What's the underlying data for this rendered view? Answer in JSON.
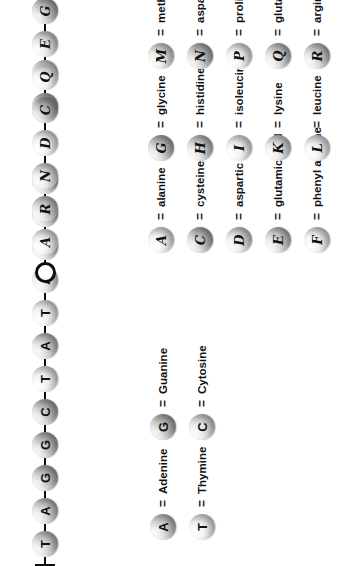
{
  "figure": {
    "orientation": "rotated-90-ccw",
    "panels": [
      "dna",
      "protein"
    ]
  },
  "dna": {
    "chain_name": "dna-strand",
    "start_marker": "bar",
    "end_marker": "solid-arrow",
    "bases": [
      "T",
      "A",
      "G",
      "G",
      "C",
      "T",
      "A",
      "T",
      "A",
      "A",
      "C",
      "C",
      "…",
      "G",
      "C"
    ],
    "gap_after_index": 11,
    "legend": {
      "column_1": [
        {
          "symbol": "A",
          "equals": "=",
          "name": "Adenine",
          "tone": "tone-3"
        },
        {
          "symbol": "T",
          "equals": "=",
          "name": "Thymine",
          "tone": "tone-1"
        }
      ],
      "column_2": [
        {
          "symbol": "G",
          "equals": "=",
          "name": "Guanine",
          "tone": "tone-4"
        },
        {
          "symbol": "C",
          "equals": "=",
          "name": "Cytosine",
          "tone": "tone-2"
        }
      ]
    }
  },
  "protein": {
    "chain_name": "amino-acid-chain",
    "start_marker": "ring",
    "end_marker": "hollow-arrow",
    "residues": [
      "A",
      "R",
      "N",
      "D",
      "C",
      "Q",
      "E",
      "G",
      "H",
      "I",
      "L",
      "K",
      "…",
      "K",
      "H"
    ],
    "gap_after_index": 11,
    "legend": {
      "column_1": [
        {
          "symbol": "A",
          "equals": "=",
          "name": "alanine",
          "tone": "tone-1"
        },
        {
          "symbol": "C",
          "equals": "=",
          "name": "cysteine",
          "tone": "tone-4"
        },
        {
          "symbol": "D",
          "equals": "=",
          "name": "aspartic acid",
          "tone": "tone-2"
        },
        {
          "symbol": "E",
          "equals": "=",
          "name": "glutamic acid",
          "tone": "tone-3"
        },
        {
          "symbol": "F",
          "equals": "=",
          "name": "phenyl alanine",
          "tone": "tone-1"
        }
      ],
      "column_2": [
        {
          "symbol": "G",
          "equals": "=",
          "name": "glycine",
          "tone": "tone-4"
        },
        {
          "symbol": "H",
          "equals": "=",
          "name": "histidine",
          "tone": "tone-3"
        },
        {
          "symbol": "I",
          "equals": "=",
          "name": "isoleucine",
          "tone": "tone-1"
        },
        {
          "symbol": "K",
          "equals": "=",
          "name": "lysine",
          "tone": "tone-2"
        },
        {
          "symbol": "L",
          "equals": "=",
          "name": "leucine",
          "tone": "tone-1"
        }
      ],
      "column_3": [
        {
          "symbol": "M",
          "equals": "=",
          "name": "methionine",
          "tone": "tone-2"
        },
        {
          "symbol": "N",
          "equals": "=",
          "name": "asparagine",
          "tone": "tone-4"
        },
        {
          "symbol": "P",
          "equals": "=",
          "name": "proline",
          "tone": "tone-1"
        },
        {
          "symbol": "Q",
          "equals": "=",
          "name": "glutamine",
          "tone": "tone-3"
        },
        {
          "symbol": "R",
          "equals": "=",
          "name": "arginine",
          "tone": "tone-3"
        }
      ],
      "column_4": [
        {
          "symbol": "S",
          "equals": "=",
          "name": "serine",
          "tone": "tone-2"
        },
        {
          "symbol": "T",
          "equals": "=",
          "name": "threonine",
          "tone": "tone-3"
        },
        {
          "symbol": "V",
          "equals": "=",
          "name": "valine",
          "tone": "tone-1"
        },
        {
          "symbol": "W",
          "equals": "=",
          "name": "tryptophane",
          "tone": "tone-1"
        },
        {
          "symbol": "Y",
          "equals": "=",
          "name": "tyrosine",
          "tone": "tone-4"
        }
      ]
    }
  }
}
